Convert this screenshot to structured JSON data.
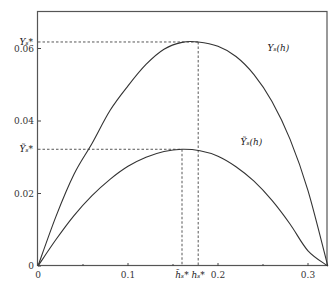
{
  "chart_data": {
    "type": "line",
    "title": "",
    "xlabel": "",
    "ylabel": "",
    "xlim": [
      0,
      0.322
    ],
    "ylim": [
      0,
      0.0708
    ],
    "grid": false,
    "x_ticks": [
      {
        "value": 0,
        "label": "0"
      },
      {
        "value": 0.1,
        "label": "0.1"
      },
      {
        "value": 0.2,
        "label": "0.2"
      },
      {
        "value": 0.3,
        "label": "0.3"
      }
    ],
    "x_minor_ticks": [
      0.05,
      0.15,
      0.25
    ],
    "y_ticks": [
      {
        "value": 0,
        "label": "0"
      },
      {
        "value": 0.02,
        "label": "0.02"
      },
      {
        "value": 0.04,
        "label": "0.04"
      },
      {
        "value": 0.06,
        "label": "0.06"
      }
    ],
    "series": [
      {
        "name": "Y_s(h)",
        "label": "Yₛ(h)",
        "x": [
          0,
          0.02,
          0.04,
          0.06,
          0.08,
          0.1,
          0.12,
          0.14,
          0.16,
          0.178,
          0.2,
          0.22,
          0.24,
          0.26,
          0.28,
          0.3,
          0.322
        ],
        "y": [
          0,
          0.0137,
          0.0253,
          0.0338,
          0.0429,
          0.0497,
          0.0556,
          0.0598,
          0.0617,
          0.0618,
          0.0606,
          0.0578,
          0.0528,
          0.0454,
          0.035,
          0.0208,
          0
        ]
      },
      {
        "name": "Ytilde_s(h)",
        "label": "Ỹₛ(h)",
        "x": [
          0,
          0.02,
          0.04,
          0.06,
          0.08,
          0.1,
          0.12,
          0.14,
          0.16,
          0.18,
          0.2,
          0.22,
          0.24,
          0.26,
          0.28,
          0.3,
          0.322
        ],
        "y": [
          0,
          0.0073,
          0.0139,
          0.0194,
          0.0239,
          0.0275,
          0.03,
          0.0316,
          0.0322,
          0.0318,
          0.0303,
          0.0274,
          0.0234,
          0.0181,
          0.0116,
          0.0042,
          0
        ]
      }
    ],
    "annotations": [
      {
        "type": "hguide",
        "y": 0.0618,
        "x_end": 0.178,
        "label": "Yₛ*"
      },
      {
        "type": "vguide",
        "x": 0.178,
        "y_end": 0.0618,
        "label": "hₛ*"
      },
      {
        "type": "hguide",
        "y": 0.0322,
        "x_end": 0.16,
        "label": "Ỹₛ*"
      },
      {
        "type": "vguide",
        "x": 0.16,
        "y_end": 0.0322,
        "label": "h̃ₛ*"
      }
    ],
    "curve_labels": [
      {
        "series": "Y_s(h)",
        "text": "Yₛ(h)",
        "x": 0.255,
        "y": 0.0592
      },
      {
        "series": "Ytilde_s(h)",
        "text": "Ỹₛ(h)",
        "x": 0.225,
        "y": 0.0335
      }
    ]
  }
}
